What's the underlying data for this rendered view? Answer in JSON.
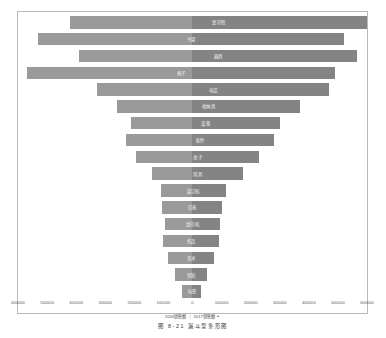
{
  "chart_data": {
    "type": "bar",
    "orientation": "horizontal-diverging",
    "title": "",
    "subtitle": "",
    "xlabel": "",
    "ylabel": "",
    "xlim": [
      -600000,
      600000
    ],
    "grid": false,
    "legend_position": "bottom",
    "tick_labels": [
      "600000",
      "500000",
      "400000",
      "300000",
      "200000",
      "100000",
      "0",
      "100000",
      "200000",
      "300000",
      "400000",
      "500000",
      "600000"
    ],
    "tick_values": [
      -600000,
      -500000,
      -400000,
      -300000,
      -200000,
      -100000,
      0,
      100000,
      200000,
      300000,
      400000,
      500000,
      600000
    ],
    "categories": [
      "复印纸",
      "书架",
      "器具",
      "椅子",
      "电话",
      "收纳具",
      "设备",
      "配件",
      "桌子",
      "用具",
      "装订机",
      "信奉",
      "复印机",
      "纸品",
      "美术",
      "剪贴",
      "标签"
    ],
    "series": [
      {
        "name": "2016销售额",
        "side": "left",
        "color": "#9a9a9a",
        "values": [
          420000,
          530000,
          390000,
          570000,
          330000,
          260000,
          210000,
          230000,
          195000,
          140000,
          110000,
          105000,
          95000,
          100000,
          85000,
          60000,
          35000
        ]
      },
      {
        "name": "2017销售额",
        "side": "right",
        "color": "#848484",
        "values": [
          600000,
          520000,
          565000,
          490000,
          470000,
          370000,
          300000,
          280000,
          230000,
          175000,
          115000,
          100000,
          95000,
          90000,
          75000,
          50000,
          30000
        ]
      }
    ]
  },
  "legend": {
    "items": [
      "2016销售额",
      "2017销售额"
    ],
    "separator": "|",
    "marker": "▲"
  },
  "caption": {
    "text": "图 8-21 漏斗型条形图"
  }
}
